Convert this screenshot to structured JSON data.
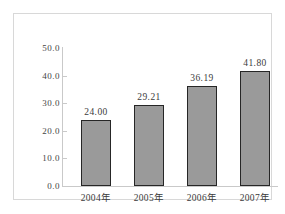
{
  "chart_data": {
    "type": "bar",
    "title": "",
    "subtitle": "",
    "xlabel": "",
    "ylabel": "",
    "categories": [
      "2004年",
      "2005年",
      "2006年",
      "2007年"
    ],
    "values": [
      24.0,
      29.21,
      36.19,
      41.8
    ],
    "data_labels": [
      "24.00",
      "29.21",
      "36.19",
      "41.80"
    ],
    "ylim": [
      0.0,
      50.0
    ],
    "ytick_values": [
      50.0,
      40.0,
      30.0,
      20.0,
      10.0,
      0.0
    ],
    "ytick_labels": [
      "50.0",
      "40.0",
      "30.0",
      "20.0",
      "10.0",
      "0.0"
    ],
    "grid": false,
    "legend": null,
    "legend_position": "none",
    "series": [
      {
        "name": "",
        "values": [
          24.0,
          29.21,
          36.19,
          41.8
        ],
        "bar_fill_color": "#9a9a9a",
        "bar_border_color": "#262626"
      }
    ],
    "axis_color": "#c9c9c9",
    "text_color": "#3b3b3b",
    "frame_border_color": "#d8d8d8",
    "background_color": "#ffffff"
  }
}
